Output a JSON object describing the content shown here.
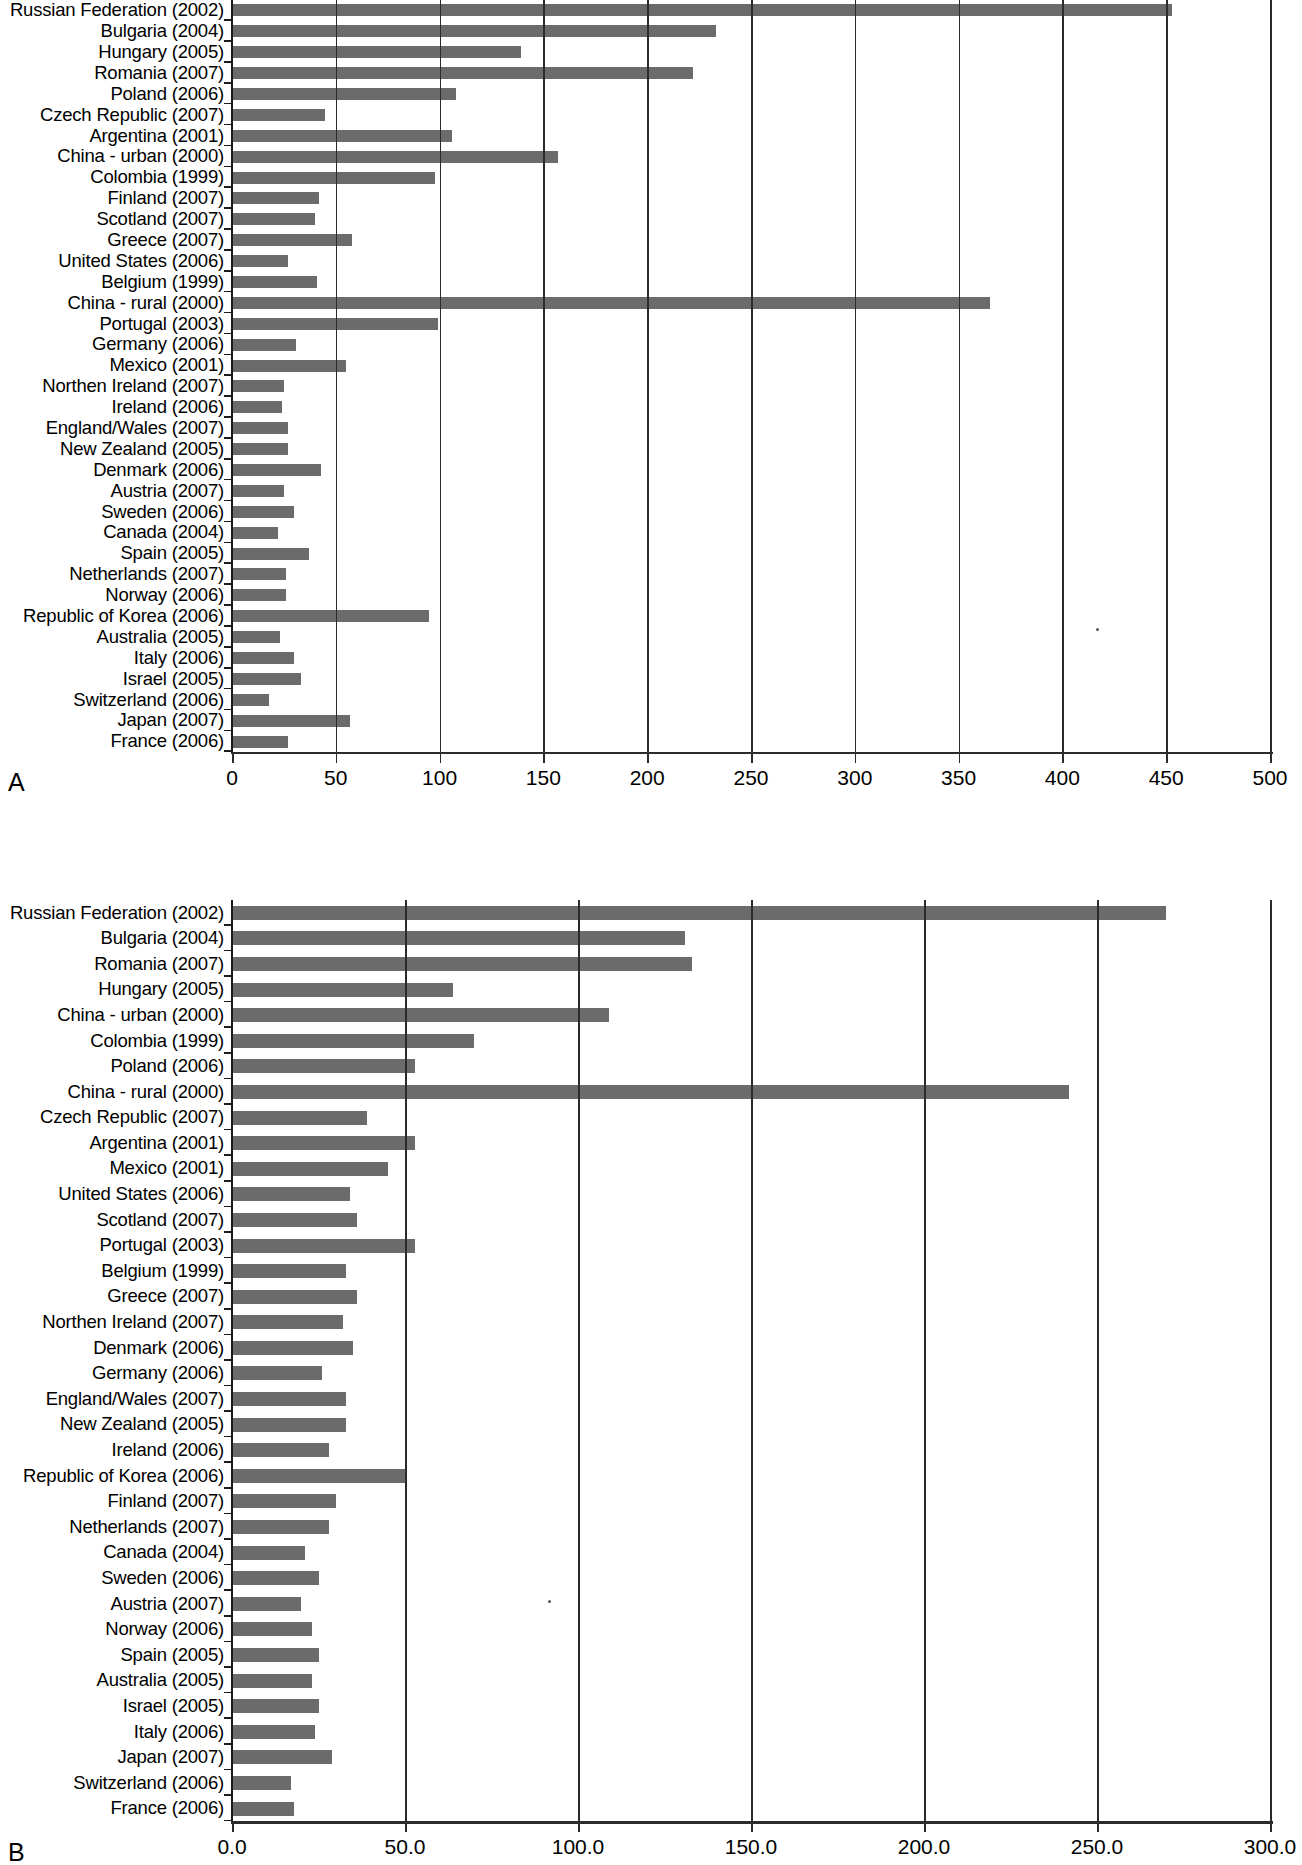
{
  "figure": {
    "panel_a_letter": "A",
    "panel_b_letter": "B"
  },
  "chart_data": [
    {
      "type": "bar",
      "orientation": "horizontal",
      "panel": "A",
      "title": "",
      "xlabel": "",
      "ylabel": "",
      "xlim": [
        0,
        500
      ],
      "xticks": [
        "0",
        "50",
        "100",
        "150",
        "200",
        "250",
        "300",
        "350",
        "400",
        "450",
        "500"
      ],
      "xtick_values": [
        0,
        50,
        100,
        150,
        200,
        250,
        300,
        350,
        400,
        450,
        500
      ],
      "grid": true,
      "legend": "none",
      "bar_color": "#6b6b6b",
      "categories": [
        "Russian Federation (2002)",
        "Bulgaria (2004)",
        "Hungary (2005)",
        "Romania (2007)",
        "Poland (2006)",
        "Czech Republic (2007)",
        "Argentina (2001)",
        "China - urban (2000)",
        "Colombia (1999)",
        "Finland (2007)",
        "Scotland (2007)",
        "Greece (2007)",
        "United States (2006)",
        "Belgium (1999)",
        "China - rural (2000)",
        "Portugal (2003)",
        "Germany (2006)",
        "Mexico (2001)",
        "Northen Ireland (2007)",
        "Ireland (2006)",
        "England/Wales (2007)",
        "New Zealand (2005)",
        "Denmark (2006)",
        "Austria (2007)",
        "Sweden (2006)",
        "Canada (2004)",
        "Spain (2005)",
        "Netherlands (2007)",
        "Norway (2006)",
        "Republic of Korea (2006)",
        "Australia (2005)",
        "Italy (2006)",
        "Israel (2005)",
        "Switzerland (2006)",
        "Japan (2007)",
        "France (2006)"
      ],
      "values": [
        453,
        233,
        139,
        222,
        108,
        45,
        106,
        157,
        98,
        42,
        40,
        58,
        27,
        41,
        365,
        99,
        31,
        55,
        25,
        24,
        27,
        27,
        43,
        25,
        30,
        22,
        37,
        26,
        26,
        95,
        23,
        30,
        33,
        18,
        57,
        27
      ]
    },
    {
      "type": "bar",
      "orientation": "horizontal",
      "panel": "B",
      "title": "",
      "xlabel": "",
      "ylabel": "",
      "xlim": [
        0,
        300
      ],
      "xticks": [
        "0.0",
        "50.0",
        "100.0",
        "150.0",
        "200.0",
        "250.0",
        "300.0"
      ],
      "xtick_values": [
        0,
        50,
        100,
        150,
        200,
        250,
        300
      ],
      "grid": true,
      "legend": "none",
      "bar_color": "#6b6b6b",
      "categories": [
        "Russian Federation (2002)",
        "Bulgaria (2004)",
        "Romania (2007)",
        "Hungary (2005)",
        "China - urban (2000)",
        "Colombia (1999)",
        "Poland (2006)",
        "China - rural (2000)",
        "Czech Republic (2007)",
        "Argentina (2001)",
        "Mexico (2001)",
        "United States (2006)",
        "Scotland (2007)",
        "Portugal (2003)",
        "Belgium (1999)",
        "Greece (2007)",
        "Northen Ireland (2007)",
        "Denmark (2006)",
        "Germany (2006)",
        "England/Wales (2007)",
        "New Zealand (2005)",
        "Ireland (2006)",
        "Republic of Korea (2006)",
        "Finland (2007)",
        "Netherlands (2007)",
        "Canada (2004)",
        "Sweden (2006)",
        "Austria (2007)",
        "Norway (2006)",
        "Spain (2005)",
        "Australia (2005)",
        "Israel (2005)",
        "Italy (2006)",
        "Japan (2007)",
        "Switzerland (2006)",
        "France (2006)"
      ],
      "values": [
        270,
        131,
        133,
        64,
        109,
        70,
        53,
        242,
        39,
        53,
        45,
        34,
        36,
        53,
        33,
        36,
        32,
        35,
        26,
        33,
        33,
        28,
        50,
        30,
        28,
        21,
        25,
        20,
        23,
        25,
        23,
        25,
        24,
        29,
        17,
        18
      ]
    }
  ]
}
